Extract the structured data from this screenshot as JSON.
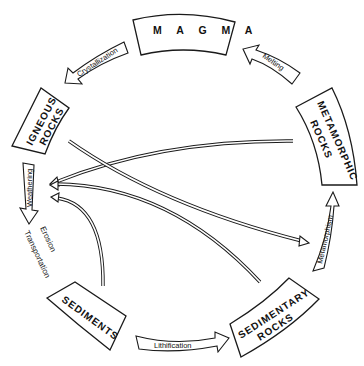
{
  "stages": {
    "magma": "M A G M A",
    "igneous_line1": "IGNEOUS",
    "igneous_line2": "ROCKS",
    "metamorphic_line1": "METAMORPHIC",
    "metamorphic_line2": "ROCKS",
    "sediments": "SEDIMENTS",
    "sedimentary_line1": "SEDIMENTARY",
    "sedimentary_line2": "ROCKS"
  },
  "processes": {
    "crystallization": "Crystallization",
    "melting": "Melting",
    "weathering": "Weathering",
    "erosion": "Erosion",
    "transportation": "Transportation",
    "lithification": "Lithification",
    "metamorphism": "Metamorphism"
  },
  "colors": {
    "line": "#1a1a1a",
    "background": "#ffffff"
  }
}
